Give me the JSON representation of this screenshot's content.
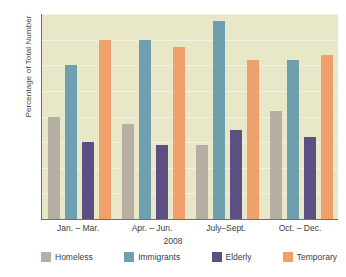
{
  "chart_data": {
    "type": "bar",
    "title": "",
    "subtitle": "",
    "xlabel": "2008",
    "ylabel": "Percentage of Total Number",
    "ylim": [
      0,
      40
    ],
    "yticks": [
      0,
      5,
      10,
      15,
      20,
      25,
      30,
      35,
      40
    ],
    "grid": true,
    "legend_position": "bottom",
    "categories": [
      "Jan. – Mar.",
      "Apr. – Jun.",
      "July–Sept.",
      "Oct. – Dec."
    ],
    "series": [
      {
        "name": "Homeless",
        "color": "#b6b0a2",
        "values": [
          20,
          18.5,
          14.5,
          21
        ]
      },
      {
        "name": "Immigrants",
        "color": "#6d9fae",
        "values": [
          30,
          35,
          38.7,
          31
        ]
      },
      {
        "name": "Elderly",
        "color": "#5b4f84",
        "values": [
          15,
          14.5,
          17.3,
          16
        ]
      },
      {
        "name": "Temporary",
        "color": "#f0a06a",
        "values": [
          35,
          33.5,
          31,
          32
        ]
      }
    ],
    "plot_background": "#e8e8c8",
    "gridline_color": "#f2f2e0",
    "axis_color": "#6f6f6f"
  }
}
